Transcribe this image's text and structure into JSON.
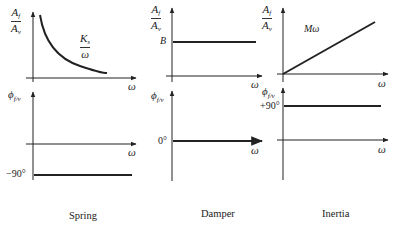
{
  "panels": [
    {
      "name": "Spring",
      "caption": "Spring",
      "magnitude": {
        "ylabel_num": "A",
        "ylabel_num_sub": "f",
        "ylabel_den": "A",
        "ylabel_den_sub": "v",
        "xlabel": "ω",
        "curve_label_num": "K",
        "curve_label_num_sub": "s",
        "curve_label_den": "ω",
        "shape": "hyperbola"
      },
      "phase": {
        "ylabel": "ϕ",
        "ylabel_sub": "f/v",
        "xlabel": "ω",
        "value_label": "−90°",
        "value": -90
      }
    },
    {
      "name": "Damper",
      "caption": "Damper",
      "magnitude": {
        "ylabel_num": "A",
        "ylabel_num_sub": "f",
        "ylabel_den": "A",
        "ylabel_den_sub": "v",
        "xlabel": "ω",
        "level_label": "B",
        "shape": "constant"
      },
      "phase": {
        "ylabel": "ϕ",
        "ylabel_sub": "f/v",
        "xlabel": "ω",
        "value_label": "0°",
        "value": 0
      }
    },
    {
      "name": "Inertia",
      "caption": "Inertia",
      "magnitude": {
        "ylabel_num": "A",
        "ylabel_num_sub": "f",
        "ylabel_den": "A",
        "ylabel_den_sub": "v",
        "xlabel": "ω",
        "curve_label": "Mω",
        "shape": "linear"
      },
      "phase": {
        "ylabel": "ϕ",
        "ylabel_sub": "f/v",
        "xlabel": "ω",
        "value_label": "+90°",
        "value": 90
      }
    }
  ],
  "colors": {
    "ink": "#222222",
    "background": "#ffffff"
  }
}
